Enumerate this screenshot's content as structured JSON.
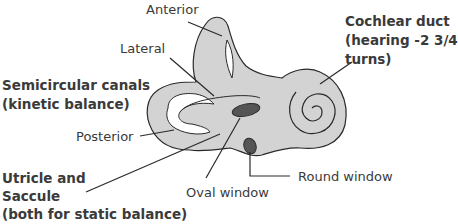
{
  "diagram": {
    "colors": {
      "fill": "#d3d3d3",
      "outline": "#2a2a2a",
      "window_fill": "#555555",
      "text": "#3a3a3a"
    },
    "labels": {
      "anterior": "Anterior",
      "lateral": "Lateral",
      "semicircular_line1": "Semicircular canals",
      "semicircular_line2": "(kinetic balance)",
      "posterior": "Posterior",
      "utricle_line1": "Utricle and",
      "utricle_line2": "Saccule",
      "utricle_line3": "(both for static balance)",
      "oval_window": "Oval window",
      "round_window": "Round window",
      "cochlear_line1": "Cochlear duct",
      "cochlear_line2": "(hearing -2 3/4",
      "cochlear_line3": "turns)"
    }
  }
}
